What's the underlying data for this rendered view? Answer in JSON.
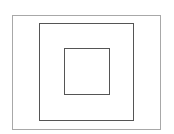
{
  "diagram": {
    "type": "nested-rectangles",
    "background": "#ffffff",
    "shapes": [
      {
        "name": "outer-rectangle",
        "x": 12,
        "y": 15,
        "width": 149,
        "height": 115,
        "stroke": "#a8a8a8",
        "stroke_width": 1
      },
      {
        "name": "middle-rectangle",
        "x": 39,
        "y": 23,
        "width": 95,
        "height": 98,
        "stroke": "#555555",
        "stroke_width": 1.5
      },
      {
        "name": "inner-rectangle",
        "x": 64,
        "y": 48,
        "width": 46,
        "height": 47,
        "stroke": "#555555",
        "stroke_width": 1.5
      }
    ]
  }
}
